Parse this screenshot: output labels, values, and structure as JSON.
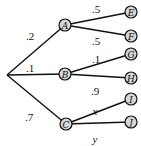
{
  "diagram": {
    "type": "probability-tree",
    "root": {
      "x": 7,
      "y": 75
    },
    "level1": [
      {
        "id": "A",
        "label": "A",
        "x": 65,
        "y": 25,
        "prob": ".2",
        "prob_pos": {
          "x": 30,
          "y": 40
        }
      },
      {
        "id": "B",
        "label": "B",
        "x": 65,
        "y": 74,
        "prob": ".1",
        "prob_pos": {
          "x": 30,
          "y": 72
        }
      },
      {
        "id": "C",
        "label": "C",
        "x": 66,
        "y": 124,
        "prob": ".7",
        "prob_pos": {
          "x": 29,
          "y": 121
        }
      }
    ],
    "level2": [
      {
        "id": "E",
        "label": "E",
        "parent": "A",
        "x": 131,
        "y": 12,
        "prob": ".5",
        "prob_pos": {
          "x": 96,
          "y": 13
        }
      },
      {
        "id": "F",
        "label": "F",
        "parent": "A",
        "x": 131,
        "y": 36,
        "prob": ".5",
        "prob_pos": {
          "x": 96,
          "y": 45
        }
      },
      {
        "id": "G",
        "label": "G",
        "parent": "B",
        "x": 131,
        "y": 54,
        "prob": ".1",
        "prob_pos": {
          "x": 96,
          "y": 63
        }
      },
      {
        "id": "H",
        "label": "H",
        "parent": "B",
        "x": 131,
        "y": 78,
        "prob": ".9",
        "prob_pos": {
          "x": 95,
          "y": 95
        }
      },
      {
        "id": "I",
        "label": "I",
        "parent": "C",
        "x": 131,
        "y": 99,
        "prob": "x",
        "prob_pos": {
          "x": 95,
          "y": 115
        }
      },
      {
        "id": "J",
        "label": "J",
        "parent": "C",
        "x": 131,
        "y": 122,
        "prob": "y",
        "prob_pos": {
          "x": 95,
          "y": 143
        }
      }
    ]
  }
}
